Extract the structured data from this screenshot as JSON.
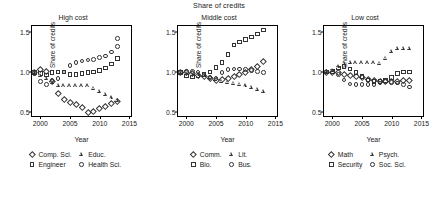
{
  "suptitle": "Share of credits",
  "axis": {
    "ylabel": "Share of credits",
    "xlabel": "Year",
    "yticks": [
      "0.5",
      "1.0",
      "1.5"
    ],
    "ytick_values": [
      0.5,
      1.0,
      1.5
    ],
    "xticks": [
      "2000",
      "2005",
      "2010",
      "2015"
    ],
    "xtick_values": [
      2000,
      2005,
      2010,
      2015
    ],
    "xlim": [
      1998.6,
      2015.6
    ],
    "ylim": [
      0.42,
      1.58
    ],
    "grid": false
  },
  "chart_data": [
    {
      "type": "scatter",
      "title": "High cost",
      "xlabel": "Year",
      "ylabel": "Share of credits",
      "xlim": [
        1998.6,
        2015.6
      ],
      "ylim": [
        0.42,
        1.58
      ],
      "x": [
        1999,
        2000,
        2001,
        2002,
        2003,
        2004,
        2005,
        2006,
        2007,
        2008,
        2009,
        2010,
        2011,
        2012,
        2013
      ],
      "series": [
        {
          "name": "Comp. Sci.",
          "marker": "diamond",
          "values": [
            1.0,
            1.03,
            1.01,
            0.88,
            0.73,
            0.65,
            0.62,
            0.59,
            0.55,
            0.49,
            0.51,
            0.54,
            0.57,
            0.6,
            0.63
          ]
        },
        {
          "name": "Engineer",
          "marker": "square",
          "values": [
            0.99,
            0.98,
            0.96,
            0.99,
            1.0,
            1.0,
            0.97,
            0.97,
            0.98,
            0.99,
            1.0,
            1.02,
            1.05,
            1.1,
            1.17
          ]
        },
        {
          "name": "Educ.",
          "marker": "triangle",
          "values": [
            0.99,
            0.95,
            0.92,
            0.87,
            0.83,
            0.82,
            0.82,
            0.82,
            0.82,
            0.82,
            0.79,
            0.75,
            0.71,
            0.67,
            0.64
          ]
        },
        {
          "name": "Health Sci.",
          "marker": "circle",
          "values": [
            0.98,
            0.88,
            0.84,
            0.89,
            0.92,
            1.0,
            1.08,
            1.12,
            1.14,
            1.15,
            1.16,
            1.18,
            1.2,
            1.25,
            1.32
          ]
        }
      ],
      "extra_points": [
        {
          "name": "Health Sci.",
          "x": 2013,
          "y": 1.42
        }
      ],
      "legend": [
        {
          "label": "Comp. Sci.",
          "marker": "diamond"
        },
        {
          "label": "Educ.",
          "marker": "triangle"
        },
        {
          "label": "Engineer",
          "marker": "square"
        },
        {
          "label": "Health Sci.",
          "marker": "circle"
        }
      ]
    },
    {
      "type": "scatter",
      "title": "Middle cost",
      "xlabel": "Year",
      "ylabel": "Share of credits",
      "xlim": [
        1998.6,
        2015.6
      ],
      "ylim": [
        0.42,
        1.58
      ],
      "x": [
        1999,
        2000,
        2001,
        2002,
        2003,
        2004,
        2005,
        2006,
        2007,
        2008,
        2009,
        2010,
        2011,
        2012,
        2013
      ],
      "series": [
        {
          "name": "Comm.",
          "marker": "diamond",
          "values": [
            1.0,
            0.99,
            0.98,
            0.96,
            0.94,
            0.92,
            0.9,
            0.91,
            0.92,
            0.94,
            0.97,
            1.0,
            1.03,
            1.07,
            1.13
          ]
        },
        {
          "name": "Bio.",
          "marker": "square",
          "values": [
            0.99,
            0.95,
            0.94,
            0.95,
            0.97,
            1.0,
            1.06,
            1.12,
            1.22,
            1.34,
            1.38,
            1.41,
            1.44,
            1.48,
            1.53
          ]
        },
        {
          "name": "Lit.",
          "marker": "triangle",
          "values": [
            0.99,
            0.98,
            0.97,
            0.96,
            0.95,
            0.93,
            0.9,
            0.88,
            0.86,
            0.85,
            0.84,
            0.82,
            0.8,
            0.78,
            0.75
          ]
        },
        {
          "name": "Bus.",
          "marker": "circle",
          "values": [
            1.0,
            1.01,
            1.01,
            1.0,
            0.97,
            0.93,
            0.92,
            0.99,
            1.03,
            1.04,
            1.04,
            1.03,
            1.02,
            1.01,
            0.99
          ]
        }
      ],
      "legend": [
        {
          "label": "Comm.",
          "marker": "diamond"
        },
        {
          "label": "Lit.",
          "marker": "triangle"
        },
        {
          "label": "Bio.",
          "marker": "square"
        },
        {
          "label": "Bus.",
          "marker": "circle"
        }
      ]
    },
    {
      "type": "scatter",
      "title": "Low cost",
      "xlabel": "Year",
      "ylabel": "Share of credits",
      "xlim": [
        1998.6,
        2015.6
      ],
      "ylim": [
        0.42,
        1.58
      ],
      "x": [
        1999,
        2000,
        2001,
        2002,
        2003,
        2004,
        2005,
        2006,
        2007,
        2008,
        2009,
        2010,
        2011,
        2012,
        2013
      ],
      "series": [
        {
          "name": "Math",
          "marker": "diamond",
          "values": [
            1.0,
            1.0,
            0.99,
            0.97,
            0.96,
            0.95,
            0.93,
            0.91,
            0.89,
            0.88,
            0.88,
            0.88,
            0.88,
            0.89,
            0.9
          ]
        },
        {
          "name": "Security",
          "marker": "square",
          "values": [
            1.0,
            1.01,
            1.05,
            1.07,
            1.04,
            0.99,
            0.94,
            0.9,
            0.88,
            0.88,
            0.89,
            0.93,
            0.98,
            1.0,
            1.0
          ]
        },
        {
          "name": "Psych.",
          "marker": "triangle",
          "values": [
            1.0,
            1.02,
            1.06,
            1.1,
            1.12,
            1.11,
            1.11,
            1.11,
            1.11,
            1.1,
            1.17,
            1.26,
            1.29,
            1.29,
            1.29
          ]
        },
        {
          "name": "Soc. Sci.",
          "marker": "circle",
          "values": [
            1.0,
            1.0,
            0.97,
            0.9,
            0.85,
            0.84,
            0.84,
            0.84,
            0.84,
            0.86,
            0.88,
            0.87,
            0.86,
            0.84,
            0.81
          ]
        }
      ],
      "legend": [
        {
          "label": "Math",
          "marker": "diamond"
        },
        {
          "label": "Psych.",
          "marker": "triangle"
        },
        {
          "label": "Security",
          "marker": "square"
        },
        {
          "label": "Soc. Sci.",
          "marker": "circle"
        }
      ]
    }
  ],
  "colors": {
    "marker_stroke": "#333333",
    "axis": "#000000",
    "background": "#ffffff"
  }
}
